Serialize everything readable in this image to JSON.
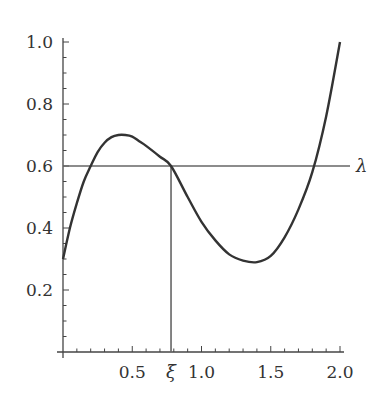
{
  "chart_data": {
    "type": "line",
    "title": "",
    "xlabel": "",
    "ylabel": "",
    "xlim": [
      0,
      2.0
    ],
    "ylim": [
      0,
      1.0
    ],
    "grid": false,
    "x_ticks": [
      {
        "value": 0.5,
        "label": "0.5"
      },
      {
        "value": 1.0,
        "label": "1.0"
      },
      {
        "value": 1.5,
        "label": "1.5"
      },
      {
        "value": 2.0,
        "label": "2.0"
      }
    ],
    "y_ticks": [
      {
        "value": 0.2,
        "label": "0.2"
      },
      {
        "value": 0.4,
        "label": "0.4"
      },
      {
        "value": 0.6,
        "label": "0.6"
      },
      {
        "value": 0.8,
        "label": "0.8"
      },
      {
        "value": 1.0,
        "label": "1.0"
      }
    ],
    "series": [
      {
        "name": "f(x)",
        "x": [
          0,
          0.05,
          0.1,
          0.15,
          0.2,
          0.25,
          0.3,
          0.35,
          0.4,
          0.45,
          0.5,
          0.55,
          0.6,
          0.7,
          0.78,
          0.9,
          1.0,
          1.1,
          1.2,
          1.3,
          1.4,
          1.5,
          1.6,
          1.7,
          1.8,
          1.9,
          2.0
        ],
        "values": [
          0.3,
          0.4,
          0.48,
          0.55,
          0.6,
          0.645,
          0.675,
          0.693,
          0.7,
          0.7,
          0.695,
          0.68,
          0.665,
          0.63,
          0.6,
          0.5,
          0.42,
          0.36,
          0.315,
          0.295,
          0.29,
          0.31,
          0.37,
          0.46,
          0.58,
          0.76,
          1.0
        ]
      }
    ],
    "annotations": [
      {
        "type": "hline",
        "y": 0.6,
        "x_from": 0,
        "x_to": 2.0,
        "label": "λ"
      },
      {
        "type": "vline",
        "x": 0.78,
        "y_from": 0,
        "y_to": 0.6,
        "label": "ξ"
      }
    ]
  },
  "labels": {
    "lambda": "λ",
    "xi": "ξ"
  },
  "colors": {
    "axis": "#444444",
    "curve": "#333333",
    "guide": "#666666"
  }
}
